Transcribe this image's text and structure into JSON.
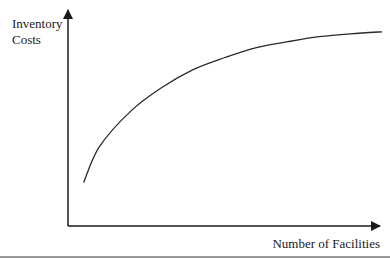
{
  "chart_data": {
    "type": "line",
    "title": "",
    "xlabel": "Number of Facilities",
    "ylabel_lines": [
      "Inventory",
      "Costs"
    ],
    "ylabel": "Inventory Costs",
    "grid": false,
    "legend": null,
    "ticks": {
      "x": [],
      "y": []
    },
    "series": [
      {
        "name": "Inventory Costs",
        "description": "Concave increasing curve that rises steeply then flattens (diminishing increase as facilities grow)",
        "x": [
          0.05,
          0.1,
          0.2,
          0.3,
          0.4,
          0.5,
          0.6,
          0.7,
          0.8,
          0.9,
          1.0
        ],
        "values": [
          0.22,
          0.4,
          0.58,
          0.7,
          0.79,
          0.85,
          0.9,
          0.93,
          0.955,
          0.97,
          0.98
        ]
      }
    ],
    "xlim": [
      0,
      1
    ],
    "ylim": [
      0,
      1.1
    ]
  },
  "colors": {
    "axis": "#1a1a1a",
    "curve": "#2a2a2a",
    "rule": "#9a9a9a"
  }
}
